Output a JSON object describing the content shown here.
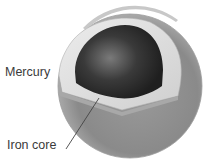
{
  "diagram": {
    "labels": {
      "planet": "Mercury",
      "core": "Iron core"
    },
    "colors": {
      "mantle_surface": "#8a8a8a",
      "mantle_cut": "#d8d8d8",
      "core": "#2a2a2a",
      "core_highlight": "#7a7a7a",
      "leader_line": "#444444"
    }
  }
}
